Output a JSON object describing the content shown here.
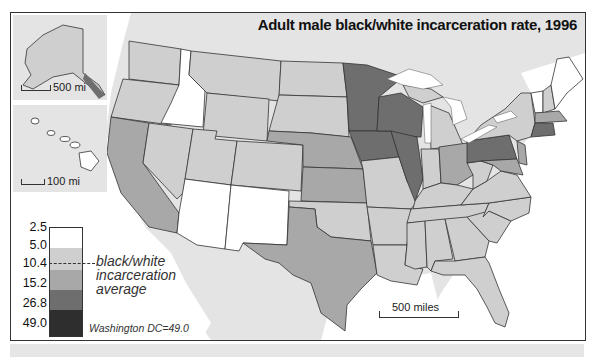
{
  "title": "Adult male black/white incarceration rate, 1996",
  "insets": {
    "alaska": {
      "scale_label": "500 mi"
    },
    "hawaii": {
      "scale_label": "100 mi"
    }
  },
  "main_scale_label": "500 miles",
  "legend": {
    "breaks": [
      "2.5",
      "5.0",
      "10.4",
      "15.2",
      "26.8",
      "49.0"
    ],
    "classes": [
      {
        "range": "2.5–5.0",
        "color": "#ffffff"
      },
      {
        "range": "5.0–10.4",
        "color": "#cfcfcf"
      },
      {
        "range": "10.4–15.2",
        "color": "#a8a8a8"
      },
      {
        "range": "15.2–26.8",
        "color": "#6e6e6e"
      },
      {
        "range": "26.8–49.0",
        "color": "#2e2e2e"
      }
    ],
    "average_label_line1": "black/white",
    "average_label_line2": "incarceration",
    "average_label_line3": "average",
    "average_value": "10.4",
    "dc_note": "Washington DC=49.0"
  },
  "colors": {
    "background_land": "#e4e4e4",
    "water": "#ffffff",
    "border": "#333333"
  },
  "state_classes": {
    "lowest": [
      "Idaho",
      "Arizona",
      "New Mexico",
      "Maine",
      "Vermont"
    ],
    "low": [
      "Washington",
      "Oregon",
      "Nevada",
      "Montana",
      "Wyoming",
      "Utah",
      "Colorado",
      "North Dakota",
      "South Dakota",
      "Oklahoma",
      "Missouri",
      "Arkansas",
      "Louisiana",
      "Mississippi",
      "Alabama",
      "Georgia",
      "Florida",
      "South Carolina",
      "North Carolina",
      "Tennessee",
      "Kentucky",
      "Indiana",
      "Michigan",
      "Virginia",
      "West Virginia",
      "New York",
      "New Hampshire",
      "Alaska"
    ],
    "middle": [
      "California",
      "Texas",
      "Nebraska",
      "Kansas",
      "Ohio",
      "New Jersey",
      "Massachusetts",
      "Delaware",
      "Maryland"
    ],
    "high": [
      "Minnesota",
      "Wisconsin",
      "Iowa",
      "Illinois",
      "Pennsylvania",
      "Connecticut",
      "Rhode Island"
    ],
    "highest": [
      "Washington DC"
    ]
  }
}
